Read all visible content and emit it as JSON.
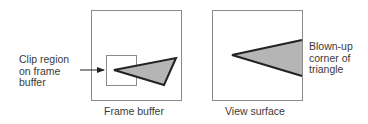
{
  "diagram": {
    "left_panel": {
      "caption": "Frame buffer",
      "callout_lines": [
        "Clip region",
        "on frame",
        "buffer"
      ]
    },
    "right_panel": {
      "caption": "View surface",
      "callout_lines": [
        "Blown-up",
        "corner of",
        "triangle"
      ]
    },
    "colors": {
      "frame_stroke": "#8a8a8a",
      "triangle_fill": "#b5b5b5",
      "triangle_stroke": "#222222",
      "text": "#3a3a3a"
    }
  }
}
